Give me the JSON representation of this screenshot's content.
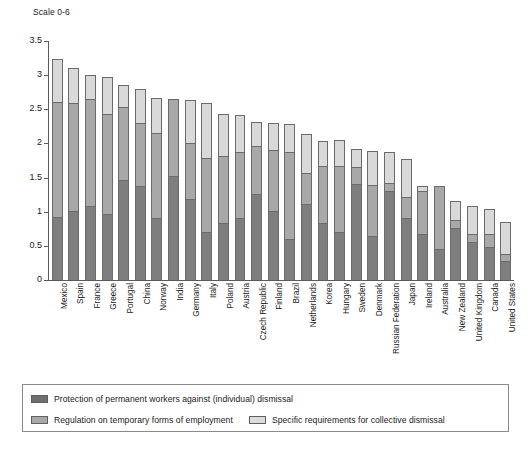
{
  "chart_data": {
    "type": "bar",
    "subtype": "stacked-bar",
    "title": "",
    "scale_note": "Scale 0-6",
    "xlabel": "",
    "ylabel": "",
    "ylim": [
      0,
      3.5
    ],
    "yticks": [
      "0",
      "0.5",
      "1",
      "1.5",
      "2",
      "2.5",
      "3",
      "3.5"
    ],
    "ytick_values": [
      0,
      0.5,
      1,
      1.5,
      2,
      2.5,
      3,
      3.5
    ],
    "grid": false,
    "legend_position": "bottom",
    "categories": [
      "Mexico",
      "Spain",
      "France",
      "Greece",
      "Portugal",
      "China",
      "Norway",
      "India",
      "Germany",
      "Italy",
      "Poland",
      "Austria",
      "Czech Republic",
      "Finland",
      "Brazil",
      "Netherlands",
      "Korea",
      "Hungary",
      "Sweden",
      "Denmark",
      "Russian Federation",
      "Japan",
      "Ireland",
      "Australia",
      "New Zealand",
      "United Kingdom",
      "Canada",
      "United States"
    ],
    "series": [
      {
        "name": "Protection of permanent workers against (individual) dismissal",
        "color": "#7e7e7e",
        "values": [
          0.93,
          1.01,
          1.09,
          0.96,
          1.47,
          1.38,
          0.91,
          1.53,
          1.18,
          0.71,
          0.84,
          0.91,
          1.26,
          1.01,
          0.6,
          1.12,
          0.83,
          0.7,
          1.41,
          0.64,
          1.3,
          0.91,
          0.67,
          0.45,
          0.76,
          0.56,
          0.49,
          0.28
        ]
      },
      {
        "name": "Regulation on temporary forms of employment",
        "color": "#a8a8a8",
        "values": [
          1.68,
          1.58,
          1.56,
          1.47,
          1.06,
          0.92,
          1.25,
          1.12,
          0.83,
          1.07,
          0.97,
          0.97,
          0.71,
          0.89,
          1.27,
          0.45,
          0.84,
          0.97,
          0.25,
          0.75,
          0.12,
          0.3,
          0.64,
          0.93,
          0.12,
          0.12,
          0.18,
          0.1
        ]
      },
      {
        "name": "Specific requirements for collective dismissal",
        "color": "#d9d9d9",
        "values": [
          0.62,
          0.52,
          0.35,
          0.54,
          0.32,
          0.5,
          0.5,
          0.0,
          0.63,
          0.81,
          0.62,
          0.53,
          0.34,
          0.4,
          0.41,
          0.57,
          0.37,
          0.38,
          0.26,
          0.5,
          0.45,
          0.56,
          0.07,
          0.0,
          0.28,
          0.41,
          0.37,
          0.47
        ]
      }
    ],
    "totals": [
      3.23,
      3.11,
      3.0,
      2.97,
      2.85,
      2.8,
      2.66,
      2.65,
      2.64,
      2.59,
      2.43,
      2.41,
      2.31,
      2.3,
      2.28,
      2.14,
      2.04,
      2.05,
      1.92,
      1.89,
      1.87,
      1.77,
      1.38,
      1.38,
      1.16,
      1.09,
      1.04,
      0.85
    ]
  },
  "legend": {
    "items": [
      {
        "label": "Protection of permanent workers against (individual) dismissal",
        "color": "#6f6f6f"
      },
      {
        "label": "Regulation on temporary forms of employment",
        "color": "#a8a8a8"
      },
      {
        "label": "Specific requirements for collective dismissal",
        "color": "#dcdcdc"
      }
    ]
  }
}
